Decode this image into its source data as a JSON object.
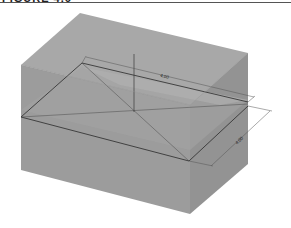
{
  "figure": {
    "title": "FIGURE 4.6"
  },
  "dimensions": {
    "length_label": "4.00",
    "width_label": "4.00"
  },
  "colors": {
    "top_face": "#a7a7a7",
    "left_face": "#9a9a9a",
    "right_face": "#8f8f8f",
    "sketch_face": "#b2b2b2",
    "line": "#2a2a2a",
    "dim_line": "#555555"
  }
}
